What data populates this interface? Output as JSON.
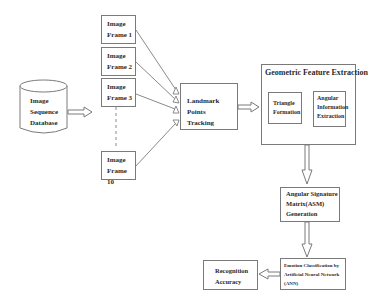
{
  "database": {
    "lines": [
      "Image",
      "Sequence",
      "Database"
    ]
  },
  "frames": [
    {
      "line1": "Image",
      "line2": "Frame 1"
    },
    {
      "line1": "Image",
      "line2": "Frame 2"
    },
    {
      "line1": "Image",
      "line2": "Frame 3"
    },
    {
      "line1": "Image",
      "line2": "Frame 10"
    }
  ],
  "landmark": {
    "lines": [
      "Landmark Points",
      "Tracking"
    ]
  },
  "geometric": {
    "title": "Geometric Feature Extraction",
    "triangle": {
      "lines": [
        "Triangle",
        "Formation"
      ]
    },
    "angular": {
      "lines": [
        "Angular",
        "Information",
        "Extraction"
      ]
    }
  },
  "asm": {
    "lines": [
      "Angular Signature",
      "Matrix(ASM)",
      "Generation"
    ]
  },
  "ann": {
    "lines": [
      "Emotion Classification by",
      "Artificial Neural Network",
      "(ANN)"
    ]
  },
  "recognition": {
    "lines": [
      "Recognition",
      "Accuracy"
    ]
  },
  "colors": {
    "line": "#7a7a7a",
    "text": "#2a2a2a",
    "background": "#ffffff"
  }
}
